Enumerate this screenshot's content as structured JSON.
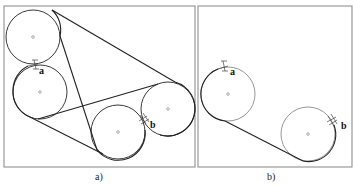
{
  "figure": {
    "panels": [
      {
        "id": "a",
        "caption": "a)",
        "frame": {
          "x": 4,
          "y": 6,
          "w": 191,
          "h": 161
        },
        "pulleys": [
          {
            "name": "top-left",
            "cx": 33,
            "cy": 37,
            "r": 27
          },
          {
            "name": "mid-left",
            "cx": 40,
            "cy": 92,
            "r": 27
          },
          {
            "name": "bottom-middle",
            "cx": 118,
            "cy": 132,
            "r": 27
          },
          {
            "name": "right",
            "cx": 168,
            "cy": 109,
            "r": 27
          }
        ],
        "labels": [
          {
            "text": "a",
            "x": 39,
            "y": 74
          },
          {
            "text": "b",
            "x": 150,
            "y": 128
          }
        ]
      },
      {
        "id": "b",
        "caption": "b)",
        "frame": {
          "x": 198,
          "y": 6,
          "w": 154,
          "h": 161
        },
        "pulleys": [
          {
            "name": "left",
            "cx": 228,
            "cy": 94,
            "r": 27
          },
          {
            "name": "right",
            "cx": 308,
            "cy": 134,
            "r": 27
          }
        ],
        "labels": [
          {
            "text": "a",
            "x": 230,
            "y": 75
          },
          {
            "text": "b",
            "x": 341,
            "y": 129
          }
        ]
      }
    ],
    "colors": {
      "frame": "#9a9a9a",
      "belt": "#222222",
      "pulley": "#3a3a3a",
      "background": "#ffffff"
    }
  }
}
